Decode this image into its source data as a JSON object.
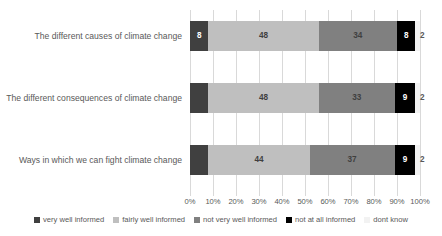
{
  "chart_data": {
    "type": "bar",
    "orientation": "horizontal",
    "stacked": true,
    "normalized": "100%",
    "title": "",
    "subtitle": "",
    "xlabel": "",
    "ylabel": "",
    "xlim": [
      0,
      100
    ],
    "grid": true,
    "legend_position": "bottom",
    "categories": [
      "The different causes of climate change",
      "The different consequences of climate change",
      "Ways in which we can fight climate change"
    ],
    "tick_labels": [
      "0%",
      "10%",
      "20%",
      "30%",
      "40%",
      "50%",
      "60%",
      "70%",
      "80%",
      "90%",
      "100%"
    ],
    "tick_values": [
      0,
      10,
      20,
      30,
      40,
      50,
      60,
      70,
      80,
      90,
      100
    ],
    "series": [
      {
        "name": "very well informed",
        "color": "#404040",
        "label_color": "#ffffff",
        "values": [
          8,
          8,
          8
        ],
        "data_labels": [
          "8",
          "",
          ""
        ]
      },
      {
        "name": "fairly well informed",
        "color": "#bfbfbf",
        "label_color": "#3f3f3f",
        "values": [
          48,
          48,
          44
        ],
        "data_labels": [
          "48",
          "48",
          "44"
        ]
      },
      {
        "name": "not very well informed",
        "color": "#808080",
        "label_color": "#3f3f3f",
        "values": [
          34,
          33,
          37
        ],
        "data_labels": [
          "34",
          "33",
          "37"
        ]
      },
      {
        "name": "not at all informed",
        "color": "#000000",
        "label_color": "#ffffff",
        "values": [
          8,
          9,
          9
        ],
        "data_labels": [
          "8",
          "9",
          "9"
        ]
      },
      {
        "name": "dont know",
        "color": "#f2f2f2",
        "label_color": "#595959",
        "values": [
          2,
          2,
          2
        ],
        "data_labels": [
          "2",
          "2",
          "2"
        ]
      }
    ]
  }
}
